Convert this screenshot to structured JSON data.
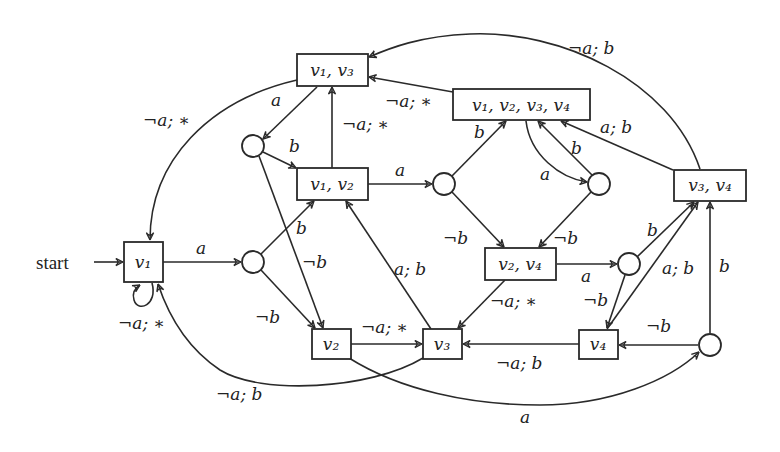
{
  "diagram": {
    "start_label": "start",
    "nodes": {
      "v1": {
        "label": "v₁"
      },
      "v2": {
        "label": "v₂"
      },
      "v3": {
        "label": "v₃"
      },
      "v4": {
        "label": "v₄"
      },
      "v1v2": {
        "label": "v₁, v₂"
      },
      "v1v3": {
        "label": "v₁, v₃"
      },
      "v1v2v3v4": {
        "label": "v₁, v₂, v₃, v₄"
      },
      "v2v4": {
        "label": "v₂, v₄"
      },
      "v3v4": {
        "label": "v₃, v₄"
      }
    },
    "intermediate_nodes": [
      "c_v1_a",
      "c_v1v3_a",
      "c_v1v2_a",
      "c_v1234_a",
      "c_v2v4_a",
      "c_bottom"
    ],
    "edges": [
      {
        "from": "start",
        "to": "v1",
        "label": ""
      },
      {
        "from": "v1",
        "to": "v1",
        "label": "¬a; ∗"
      },
      {
        "from": "v1",
        "to": "c_v1_a",
        "label": "a"
      },
      {
        "from": "c_v1_a",
        "to": "v1v2",
        "label": "b"
      },
      {
        "from": "c_v1_a",
        "to": "v2",
        "label": "¬b"
      },
      {
        "from": "v1v3",
        "to": "v1",
        "label": "¬a; ∗"
      },
      {
        "from": "v1v3",
        "to": "c_v1v3_a",
        "label": "a"
      },
      {
        "from": "c_v1v3_a",
        "to": "v1v2",
        "label": "b"
      },
      {
        "from": "c_v1v3_a",
        "to": "v2",
        "label": "¬b"
      },
      {
        "from": "v1v2",
        "to": "v1v3",
        "label": "¬a; ∗"
      },
      {
        "from": "v1v2",
        "to": "c_v1v2_a",
        "label": "a"
      },
      {
        "from": "c_v1v2_a",
        "to": "v1v2v3v4",
        "label": "b"
      },
      {
        "from": "c_v1v2_a",
        "to": "v2v4",
        "label": "¬b"
      },
      {
        "from": "v1v2v3v4",
        "to": "v1v3",
        "label": "¬a; ∗"
      },
      {
        "from": "v1v2v3v4",
        "to": "c_v1234_a",
        "label": "a"
      },
      {
        "from": "c_v1234_a",
        "to": "v1v2v3v4",
        "label": "b"
      },
      {
        "from": "c_v1234_a",
        "to": "v2v4",
        "label": "¬b"
      },
      {
        "from": "v3v4",
        "to": "v1v3",
        "label": "¬a; b"
      },
      {
        "from": "v3v4",
        "to": "v1v2v3v4",
        "label": "a; b"
      },
      {
        "from": "v3v4",
        "to": "v4",
        "label": "¬b"
      },
      {
        "from": "v2v4",
        "to": "c_v2v4_a",
        "label": "a"
      },
      {
        "from": "v2v4",
        "to": "v3",
        "label": "¬a; ∗"
      },
      {
        "from": "c_v2v4_a",
        "to": "v3v4",
        "label": "b"
      },
      {
        "from": "c_v2v4_a",
        "to": "v4",
        "label": "¬b"
      },
      {
        "from": "v4",
        "to": "v3v4",
        "label": "a; b"
      },
      {
        "from": "v4",
        "to": "v3",
        "label": "¬a; b"
      },
      {
        "from": "v3",
        "to": "v1v2",
        "label": "a; b"
      },
      {
        "from": "v3",
        "to": "v1",
        "label": "¬a; b"
      },
      {
        "from": "v2",
        "to": "v3",
        "label": "¬a; ∗"
      },
      {
        "from": "v2",
        "to": "c_bottom",
        "label": "a"
      },
      {
        "from": "c_bottom",
        "to": "v3v4",
        "label": "b"
      },
      {
        "from": "c_bottom",
        "to": "v4",
        "label": "¬b"
      }
    ],
    "edge_labels": {
      "v1_self": "¬a; ∗",
      "v1_a": "a",
      "ca_b": "b",
      "ca_nb": "¬b",
      "v13_v1": "¬a; ∗",
      "v13_a": "a",
      "cb_b": "b",
      "cb_nb": "¬b",
      "v12_v13": "¬a; ∗",
      "v12_a": "a",
      "cab_b": "b",
      "cab_nb": "¬b",
      "v1234_v13": "¬a; ∗",
      "v1234_a": "a",
      "cr_b": "b",
      "cr_nb": "¬b",
      "v34_v13": "¬a; b",
      "v34_v1234": "a; b",
      "v24_a": "a",
      "v24_v3": "¬a; ∗",
      "c24_b": "b",
      "c24_nb": "¬b",
      "v4_v34": "a; b",
      "v4_v3": "¬a; b",
      "v3_v12": "a; b",
      "v3_v1": "¬a; b",
      "v2_v3": "¬a; ∗",
      "v2_cbot": "a",
      "cbot_b": "b",
      "cbot_nb": "¬b"
    },
    "colors": {
      "stroke": "#2a2a2a",
      "background": "#ffffff",
      "text": "#222222"
    }
  }
}
